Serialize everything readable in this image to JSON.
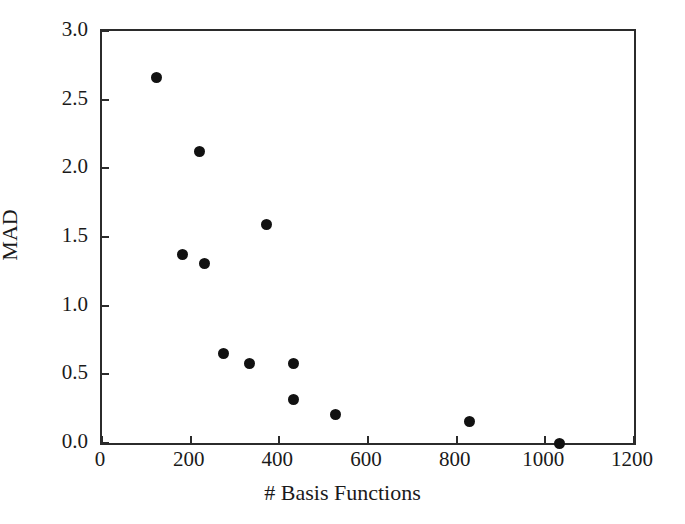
{
  "chart_data": {
    "type": "scatter",
    "title": "",
    "xlabel": "# Basis Functions",
    "ylabel": "MAD",
    "xlim": [
      0,
      1200
    ],
    "ylim": [
      0.0,
      3.0
    ],
    "xticks": [
      0,
      200,
      400,
      600,
      800,
      1000,
      1200
    ],
    "yticks": [
      0.0,
      0.5,
      1.0,
      1.5,
      2.0,
      2.5,
      3.0
    ],
    "xticklabels": [
      "0",
      "200",
      "400",
      "600",
      "800",
      "1000",
      "1200"
    ],
    "yticklabels": [
      "0.0",
      "0.5",
      "1.0",
      "1.5",
      "2.0",
      "2.5",
      "3.0"
    ],
    "grid": false,
    "legend": false,
    "marker": {
      "shape": "circle",
      "color": "#111111",
      "size_px": 11
    },
    "series": [
      {
        "name": "MAD vs basis functions",
        "points": [
          {
            "x": 124,
            "y": 2.66
          },
          {
            "x": 219,
            "y": 2.12
          },
          {
            "x": 181,
            "y": 1.37
          },
          {
            "x": 232,
            "y": 1.31
          },
          {
            "x": 372,
            "y": 1.59
          },
          {
            "x": 273,
            "y": 0.65
          },
          {
            "x": 332,
            "y": 0.58
          },
          {
            "x": 433,
            "y": 0.58
          },
          {
            "x": 433,
            "y": 0.32
          },
          {
            "x": 526,
            "y": 0.21
          },
          {
            "x": 828,
            "y": 0.16
          },
          {
            "x": 1031,
            "y": 0.0
          }
        ]
      }
    ]
  },
  "axes": {
    "frame_color": "#2b2b2b",
    "background": "#ffffff"
  }
}
